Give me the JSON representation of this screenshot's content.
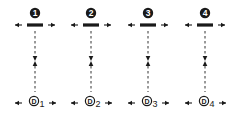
{
  "diagram": {
    "colors": {
      "ink": "#1a1a1a",
      "dash": "#333333",
      "bg": "#ffffff"
    },
    "columns": [
      {
        "top_badge": "1",
        "bottom_letter": "D",
        "bottom_subscript": "1"
      },
      {
        "top_badge": "2",
        "bottom_letter": "D",
        "bottom_subscript": "2"
      },
      {
        "top_badge": "3",
        "bottom_letter": "D",
        "bottom_subscript": "3"
      },
      {
        "top_badge": "4",
        "bottom_letter": "D",
        "bottom_subscript": "4"
      }
    ],
    "icons": {
      "top_badge": "filled-circle-number-icon",
      "bottom_node": "circled-letter-icon",
      "horizontal_arrows": "left-right-arrow-icon",
      "vertical_link": "dashed-converging-arrow-icon"
    }
  }
}
